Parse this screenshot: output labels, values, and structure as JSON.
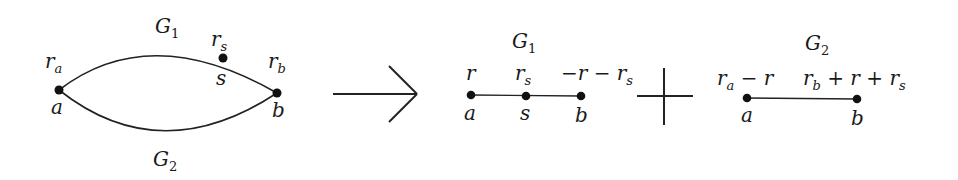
{
  "left_graph": {
    "top_label": "G",
    "top_label_sub": "1",
    "bottom_label": "G",
    "bottom_label_sub": "2",
    "nodes": {
      "a": {
        "name": "a",
        "weight": "r",
        "weight_sub": "a"
      },
      "s": {
        "name": "s",
        "weight": "r",
        "weight_sub": "s"
      },
      "b": {
        "name": "b",
        "weight": "r",
        "weight_sub": "b"
      }
    }
  },
  "arrow": {
    "icon": "right-arrow-icon"
  },
  "g1_path": {
    "title": "G",
    "title_sub": "1",
    "nodes": {
      "a": {
        "name": "a",
        "weight": "r"
      },
      "s": {
        "name": "s",
        "weight": "r",
        "weight_sub": "s"
      },
      "b": {
        "name": "b",
        "weight_pre": "−r − r",
        "weight_sub": "s"
      }
    }
  },
  "plus": {
    "icon": "plus-icon"
  },
  "g2_path": {
    "title": "G",
    "title_sub": "2",
    "nodes": {
      "a": {
        "name": "a",
        "weight_r": "r",
        "weight_sub": "a",
        "weight_rest": " − r"
      },
      "b": {
        "name": "b",
        "weight_r": "r",
        "weight_sub": "b",
        "weight_mid": " + r + r",
        "weight_sub2": "s"
      }
    }
  }
}
